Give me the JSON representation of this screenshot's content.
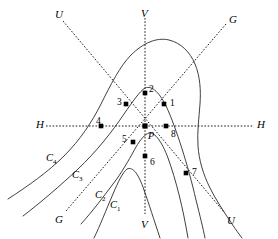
{
  "figure": {
    "width": 278,
    "height": 239,
    "background_color": "#ffffff",
    "line_color": "#2a2a2a",
    "axis_color": "#1a1a1a",
    "point_color": "#000000"
  },
  "axes": [
    {
      "id": "axis-h",
      "name": "H",
      "style": "dotted",
      "start_label": "H",
      "end_label": "H",
      "start_label_pos": [
        36,
        119
      ],
      "end_label_pos": [
        257,
        119
      ],
      "x1": 46,
      "y1": 126,
      "x2": 254,
      "y2": 126
    },
    {
      "id": "axis-v",
      "name": "V",
      "style": "dotted",
      "start_label": "V",
      "end_label": "V",
      "start_label_pos": [
        141,
        8
      ],
      "end_label_pos": [
        141,
        219
      ],
      "x1": 145,
      "y1": 18,
      "x2": 145,
      "y2": 214
    },
    {
      "id": "axis-u",
      "name": "U",
      "style": "dotted",
      "start_label": "U",
      "end_label": "U",
      "start_label_pos": [
        55,
        9
      ],
      "end_label_pos": [
        227,
        215
      ],
      "x1": 63,
      "y1": 21,
      "x2": 224,
      "y2": 212
    },
    {
      "id": "axis-g",
      "name": "G",
      "style": "dotted",
      "start_label": "G",
      "end_label": "G",
      "start_label_pos": [
        229,
        14
      ],
      "end_label_pos": [
        55,
        214
      ],
      "x1": 226,
      "y1": 24,
      "x2": 66,
      "y2": 211
    }
  ],
  "centre": {
    "label": "P",
    "x": 145,
    "y": 126,
    "label_pos": [
      148,
      131
    ]
  },
  "points": [
    {
      "label": "1",
      "x": 164,
      "y": 104,
      "label_pos": [
        170,
        99
      ]
    },
    {
      "label": "2",
      "x": 145,
      "y": 93,
      "label_pos": [
        149,
        85
      ]
    },
    {
      "label": "3",
      "x": 126,
      "y": 104,
      "label_pos": [
        117,
        98
      ]
    },
    {
      "label": "4",
      "x": 101,
      "y": 126,
      "label_pos": [
        96,
        117
      ]
    },
    {
      "label": "5",
      "x": 133,
      "y": 142,
      "label_pos": [
        122,
        135
      ]
    },
    {
      "label": "6",
      "x": 145,
      "y": 156,
      "label_pos": [
        150,
        158
      ]
    },
    {
      "label": "7",
      "x": 186,
      "y": 173,
      "label_pos": [
        192,
        168
      ]
    },
    {
      "label": "8",
      "x": 166,
      "y": 126,
      "label_pos": [
        171,
        130
      ]
    }
  ],
  "curves": [
    {
      "id": "c1",
      "label": "C",
      "subscript": "1",
      "label_pos": [
        110,
        200
      ],
      "path": "M 94 238 C 100 226 106 210 113 194 C 118 182 123 172 127 169 C 133 166 139 175 144 190 C 149 204 154 220 160 238"
    },
    {
      "id": "c2",
      "label": "C",
      "subscript": "2",
      "label_pos": [
        95,
        190
      ],
      "path": "M 81 224 C 92 212 104 196 116 180 C 124 169 131 156 136 147 C 140 140 145 134 149 133 C 155 132 162 142 168 158 C 176 180 183 208 188 238"
    },
    {
      "id": "c3",
      "label": "C",
      "subscript": "3",
      "label_pos": [
        72,
        170
      ],
      "path": "M 23 216 C 40 203 60 186 78 169 C 96 152 112 132 124 114 C 133 101 140 91 145 88 C 152 85 160 93 167 108 C 176 128 188 165 196 200 C 200 216 203 228 205 238"
    },
    {
      "id": "c4",
      "label": "C",
      "subscript": "4",
      "label_pos": [
        46,
        153
      ],
      "path": "M 8 199 C 28 186 48 172 64 156 C 80 140 92 122 101 104 C 110 86 120 66 131 55 C 143 43 157 37 169 40 C 181 43 190 52 195 64 C 200 76 201 90 200 104 C 199 118 197 132 198 146 C 199 160 203 174 210 188 C 216 200 224 212 232 224 C 236 230 239 234 242 238"
    }
  ],
  "notes": {
    "point_count": 8,
    "curve_count": 4,
    "axis_count": 4
  }
}
